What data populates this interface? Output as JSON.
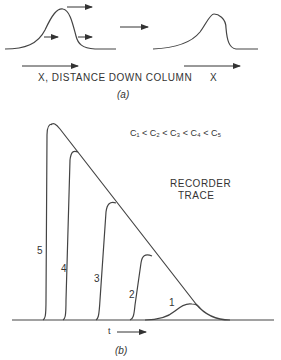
{
  "panel_a": {
    "axis_label_left": "X, DISTANCE DOWN COLUMN",
    "axis_label_right": "X",
    "caption": "(a)"
  },
  "panel_b": {
    "inequality": "C₁ < C₂ < C₃ < C₄ < C₅",
    "trace_label_line1": "RECORDER",
    "trace_label_line2": "TRACE",
    "time_label": "t",
    "caption": "(b)",
    "peak_labels": [
      "1",
      "2",
      "3",
      "4",
      "5"
    ]
  }
}
